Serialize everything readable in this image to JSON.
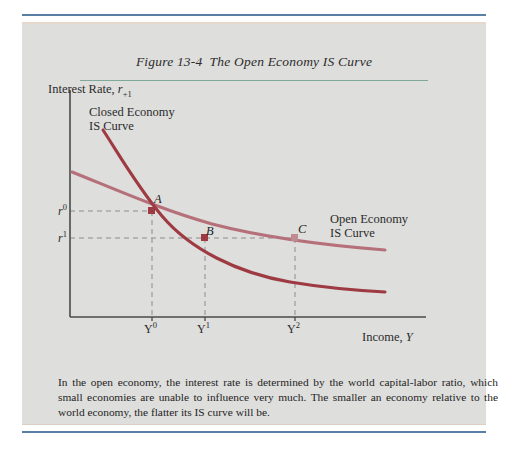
{
  "figure": {
    "title_prefix": "Figure 13-4",
    "title_main": "The Open Economy ",
    "title_smallcaps": "IS",
    "title_suffix": " Curve",
    "caption": "In the open economy, the interest rate is determined by the world capital-labor ratio, which small economies are unable to influence very much. The smaller an economy relative to the world economy, the flatter its IS curve will be."
  },
  "axes": {
    "y_title_text": "Interest Rate, ",
    "y_title_var": "r",
    "y_title_sub": "+1",
    "x_title_text": "Income, ",
    "x_title_var": "Y",
    "y_ticks": [
      {
        "var": "r",
        "sup": "0"
      },
      {
        "var": "r",
        "sup": "1"
      }
    ],
    "x_ticks": [
      {
        "var": "Y",
        "sup": "0"
      },
      {
        "var": "Y",
        "sup": "1"
      },
      {
        "var": "Y",
        "sup": "2"
      }
    ]
  },
  "curve_labels": {
    "closed_line1": "Closed Economy",
    "closed_line2_smallcaps": "IS",
    "closed_line2_rest": " Curve",
    "open_line1": "Open Economy",
    "open_line2_smallcaps": "IS",
    "open_line2_rest": " Curve"
  },
  "points": [
    {
      "label": "A",
      "x_tick": "Y0",
      "y_tick": "r0"
    },
    {
      "label": "B",
      "x_tick": "Y1",
      "y_tick": "r1"
    },
    {
      "label": "C",
      "x_tick": "Y2",
      "y_tick": "r1"
    }
  ],
  "colors": {
    "closed_curve": "#9e3a42",
    "open_curve": "#b5707a",
    "rule_blue": "#5a7fa6",
    "rule_teal": "#7fa99b",
    "panel_bg": "#dededc",
    "axis": "#4a4a4a"
  },
  "chart_data": {
    "type": "line",
    "xlabel": "Income, Y",
    "ylabel": "Interest Rate, r+1",
    "grid": false,
    "legend": "inline-annotations",
    "xlim": [
      0,
      100
    ],
    "ylim": [
      0,
      100
    ],
    "series": [
      {
        "name": "Closed Economy IS Curve",
        "color": "#9e3a42",
        "points": [
          [
            11,
            93
          ],
          [
            20,
            72
          ],
          [
            28,
            58
          ],
          [
            40,
            44
          ],
          [
            55,
            35
          ],
          [
            70,
            30
          ],
          [
            85,
            27
          ],
          [
            97,
            26
          ]
        ]
      },
      {
        "name": "Open Economy IS Curve",
        "color": "#b5707a",
        "points": [
          [
            1,
            79
          ],
          [
            12,
            72
          ],
          [
            28,
            63
          ],
          [
            45,
            55
          ],
          [
            62,
            50
          ],
          [
            78,
            47
          ],
          [
            92,
            45
          ],
          [
            100,
            44
          ]
        ]
      }
    ],
    "annotated_points": [
      {
        "label": "A",
        "x": 27,
        "y": 65,
        "on_series": "both",
        "color": "#9e3a42"
      },
      {
        "label": "B",
        "x": 48,
        "y": 54,
        "on_series": "Closed Economy IS Curve",
        "color": "#9e3a42"
      },
      {
        "label": "C",
        "x": 77,
        "y": 54,
        "on_series": "Open Economy IS Curve",
        "color": "#c08a92"
      }
    ],
    "x_tick_values": [
      27,
      48,
      77
    ],
    "x_tick_labels": [
      "Y0",
      "Y1",
      "Y2"
    ],
    "y_tick_values": [
      65,
      54
    ],
    "y_tick_labels": [
      "r0",
      "r1"
    ]
  }
}
